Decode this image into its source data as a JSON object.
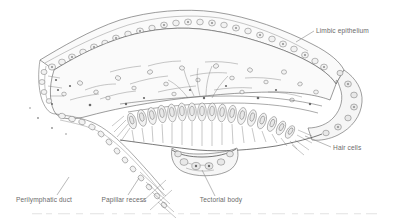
{
  "figure": {
    "style": "pen-and-ink greyscale scientific illustration",
    "background_color": "#ffffff",
    "ink_color": "#5d5d5d",
    "label_color": "#6b6b6b",
    "leader_color": "#8a8a8a"
  },
  "labels": [
    {
      "id": "limbic-epithelium",
      "text": "Limbic epithelium",
      "x": 316,
      "y": 33,
      "anchor": "start",
      "leader": "M 314 31 L 296 42"
    },
    {
      "id": "hair-cells",
      "text": "Hair cells",
      "x": 333,
      "y": 150,
      "anchor": "start",
      "leader": "M 331 147 L 305 136"
    },
    {
      "id": "tectorial-body",
      "text": "Tectorial body",
      "x": 221,
      "y": 202,
      "anchor": "middle",
      "leader": "M 215 196 L 202 170"
    },
    {
      "id": "papillar-recess",
      "text": "Papillar recess",
      "x": 124,
      "y": 202,
      "anchor": "middle",
      "leader": "M 128 195 L 139 178"
    },
    {
      "id": "perilymphatic-duct",
      "text": "Perilymphatic duct",
      "x": 44,
      "y": 202,
      "anchor": "middle",
      "leader": "M 57 195 L 69 177"
    }
  ],
  "caption": {
    "text": "",
    "visible": false,
    "note": "A line of caption text is cropped at the bottom edge and is illegible"
  },
  "structures": [
    {
      "id": "limbic-epithelium-band",
      "description": "arched upper epithelial band studded with round cells"
    },
    {
      "id": "limbus-body",
      "description": "pale fibrous mass beneath the epithelium"
    },
    {
      "id": "hair-cell-row",
      "description": "row of elongated sensory hair cells with oval nuclei"
    },
    {
      "id": "tectorial-body-mass",
      "description": "dark lobed gelatinous mass below the hair cells"
    },
    {
      "id": "papillar-recess-duct",
      "description": "chain of cells forming the descending duct wall"
    },
    {
      "id": "perilymphatic-duct-space",
      "description": "open space at lower left"
    }
  ]
}
